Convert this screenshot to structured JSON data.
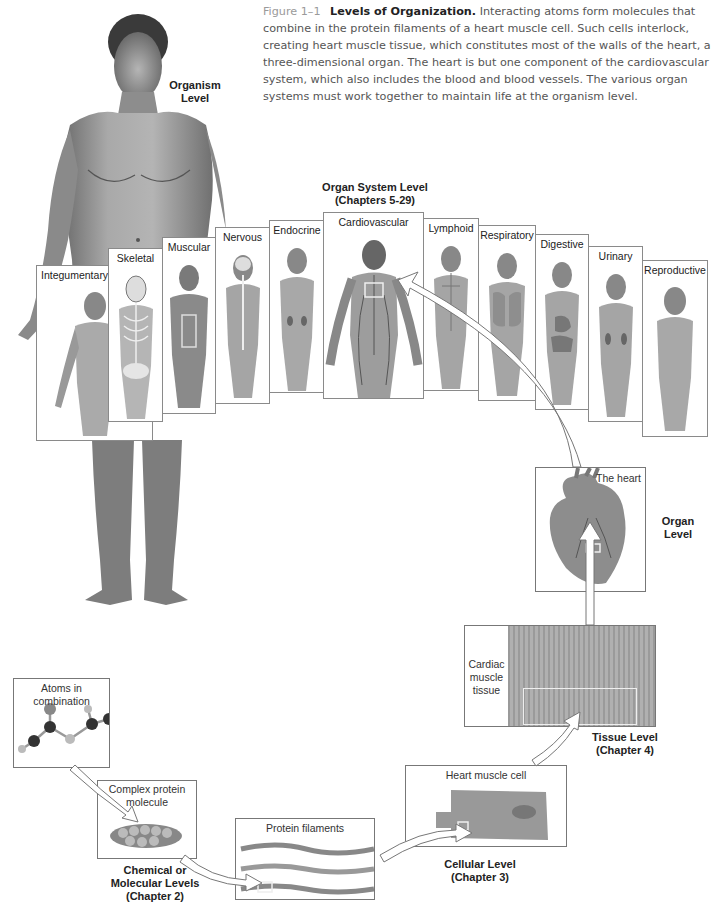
{
  "caption": {
    "figure_label": "Figure 1–1",
    "title": "Levels of Organization.",
    "text": "Interacting atoms form molecules that combine in the protein filaments of a heart muscle cell. Such cells interlock, creating heart muscle tissue, which constitutes most of the walls of the heart, a three-dimensional organ. The heart is but one component of the cardiovascular system, which also includes the blood and blood vessels. The various organ systems must work together to maintain life at the organism level."
  },
  "levels": {
    "organism": {
      "line1": "Organism",
      "line2": "Level"
    },
    "organ_system": {
      "line1": "Organ System Level",
      "line2": "(Chapters 5-29)"
    },
    "organ": {
      "line1": "Organ",
      "line2": "Level"
    },
    "tissue": {
      "line1": "Tissue Level",
      "line2": "(Chapter 4)"
    },
    "cellular": {
      "line1": "Cellular Level",
      "line2": "(Chapter 3)"
    },
    "chemical": {
      "line1": "Chemical or",
      "line2": "Molecular Levels",
      "line3": "(Chapter 2)"
    }
  },
  "systems": [
    {
      "label": "Integumentary"
    },
    {
      "label": "Skeletal"
    },
    {
      "label": "Muscular"
    },
    {
      "label": "Nervous"
    },
    {
      "label": "Endocrine"
    },
    {
      "label": "Cardiovascular"
    },
    {
      "label": "Lymphoid"
    },
    {
      "label": "Respiratory"
    },
    {
      "label": "Digestive"
    },
    {
      "label": "Urinary"
    },
    {
      "label": "Reproductive"
    }
  ],
  "boxes": {
    "heart": "The heart",
    "tissue": {
      "line1": "Cardiac",
      "line2": "muscle",
      "line3": "tissue"
    },
    "cell": "Heart muscle cell",
    "filaments": "Protein filaments",
    "protein": {
      "line1": "Complex protein",
      "line2": "molecule"
    },
    "atoms": {
      "line1": "Atoms in",
      "line2": "combination"
    }
  }
}
